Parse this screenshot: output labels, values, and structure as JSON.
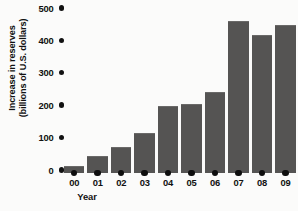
{
  "chart_data": {
    "type": "bar",
    "title": "",
    "subtitle": "",
    "xlabel": "Year",
    "ylabel": "Increase in reserves (billions of U.S. dollars)",
    "ylabel_line1": "Increase in reserves",
    "ylabel_line2": "(billions of U.S. dollars)",
    "categories": [
      "00",
      "01",
      "02",
      "03",
      "04",
      "05",
      "06",
      "07",
      "08",
      "09"
    ],
    "values": [
      22,
      52,
      80,
      122,
      208,
      212,
      250,
      470,
      425,
      458
    ],
    "series": [
      {
        "name": "Increase in reserves",
        "values": [
          22,
          52,
          80,
          122,
          208,
          212,
          250,
          470,
          425,
          458
        ]
      }
    ],
    "ylim": [
      0,
      500
    ],
    "yticks": [
      0,
      100,
      200,
      300,
      400,
      500
    ],
    "ytick_labels": [
      "0",
      "100",
      "200",
      "300",
      "400",
      "500"
    ],
    "grid": false,
    "legend": false,
    "legend_position": "none",
    "tick_marker_style": "dot",
    "annotations": [],
    "colors": {
      "bar": "#555453",
      "background": "#fbfbfa",
      "text": "#111111",
      "tick_dot": "#0e0e0e"
    }
  }
}
